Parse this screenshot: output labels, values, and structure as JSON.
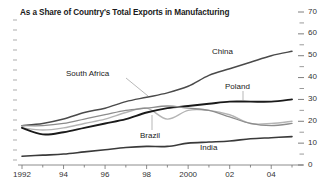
{
  "chart_data": {
    "type": "line",
    "title": "As a Share of Country's Total Exports in Manufacturing",
    "xlabel": "",
    "ylabel": "",
    "ylim": [
      0,
      70
    ],
    "ytick_values": [
      0,
      10,
      20,
      30,
      40,
      50,
      60,
      70
    ],
    "ytick_labels": [
      "0",
      "10",
      "20",
      "30",
      "40",
      "50",
      "60",
      "70"
    ],
    "y_minor_step": 5,
    "yaxis_position": "right",
    "grid": false,
    "legend": "inline-annotations",
    "x": [
      1992,
      1993,
      1994,
      1995,
      1996,
      1997,
      1998,
      1999,
      2000,
      2001,
      2002,
      2003,
      2004,
      2005
    ],
    "xtick_values": [
      1992,
      1993,
      1994,
      1995,
      1996,
      1997,
      1998,
      1999,
      2000,
      2001,
      2002,
      2003,
      2004,
      2005
    ],
    "xtick_labels": [
      "1992",
      "",
      "94",
      "",
      "96",
      "",
      "98",
      "",
      "2000",
      "",
      "02",
      "",
      "04",
      ""
    ],
    "series": [
      {
        "name": "China",
        "color": "#4a4a4a",
        "width": 1.5,
        "values": [
          18,
          19,
          21,
          24,
          26,
          29,
          31,
          33,
          36,
          41,
          44,
          47,
          50,
          52
        ]
      },
      {
        "name": "South Africa",
        "color": "#b4b4b4",
        "width": 1.4,
        "values": [
          17,
          16,
          17,
          19,
          21,
          24,
          26,
          21,
          25,
          25,
          23,
          19,
          19,
          20
        ]
      },
      {
        "name": "Poland",
        "color": "#1a1a1a",
        "width": 1.9,
        "values": [
          17,
          14,
          15,
          17,
          19,
          21,
          24,
          26,
          27,
          28,
          29,
          29,
          29,
          30
        ]
      },
      {
        "name": "Brazil",
        "color": "#8c8c8c",
        "width": 1.3,
        "values": [
          18,
          18,
          19,
          21,
          23,
          25,
          26,
          27,
          26,
          25,
          22,
          19,
          18,
          19
        ]
      },
      {
        "name": "India",
        "color": "#3a3a3a",
        "width": 1.6,
        "values": [
          4,
          4.5,
          5,
          6,
          7,
          8,
          8.5,
          8.5,
          10,
          10.5,
          11,
          12,
          12.5,
          13
        ]
      }
    ],
    "annotations": [
      {
        "label": "China",
        "x": 212,
        "y": 47,
        "leader": null
      },
      {
        "label": "South Africa",
        "x": 66,
        "y": 69,
        "leader": {
          "x1": 126,
          "y1": 78,
          "x2": 148,
          "y2": 96
        }
      },
      {
        "label": "Poland",
        "x": 225,
        "y": 82,
        "leader": {
          "x1": 243,
          "y1": 91,
          "x2": 243,
          "y2": 100
        }
      },
      {
        "label": "Brazil",
        "x": 140,
        "y": 131,
        "leader": {
          "x1": 152,
          "y1": 130,
          "x2": 152,
          "y2": 115
        }
      },
      {
        "label": "India",
        "x": 200,
        "y": 143,
        "leader": null
      }
    ]
  }
}
